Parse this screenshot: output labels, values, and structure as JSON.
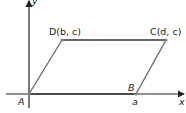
{
  "figure": {
    "type": "parallelogram-on-coordinate-plane",
    "axes": {
      "x_label": "x",
      "y_label": "y"
    },
    "points": [
      {
        "name": "A",
        "label": "A",
        "coord_label": ""
      },
      {
        "name": "B",
        "label": "B",
        "coord_label": "a"
      },
      {
        "name": "C",
        "label": "C(d,  c)"
      },
      {
        "name": "D",
        "label": "D(b,  c)"
      }
    ],
    "colors": {
      "axis": "#222222",
      "side": "#555555",
      "vertex": "#888888"
    }
  }
}
